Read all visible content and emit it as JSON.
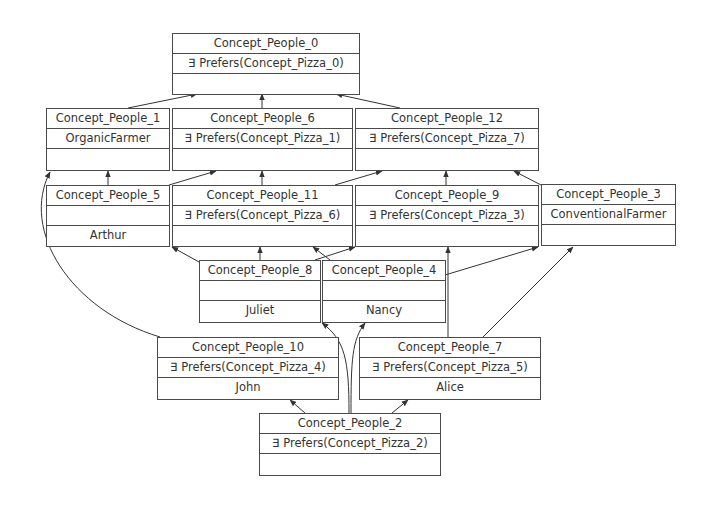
{
  "diagram": {
    "type": "concept-lattice",
    "colors": {
      "border": "#4a4a4a",
      "text": "#333333",
      "edge": "#333333",
      "background": "#ffffff"
    },
    "nodes": {
      "c0": {
        "title": "Concept_People_0",
        "attributes": "∃ Prefers(Concept_Pizza_0)",
        "objects": ""
      },
      "c1": {
        "title": "Concept_People_1",
        "attributes": "OrganicFarmer",
        "objects": ""
      },
      "c6": {
        "title": "Concept_People_6",
        "attributes": "∃ Prefers(Concept_Pizza_1)",
        "objects": ""
      },
      "c12": {
        "title": "Concept_People_12",
        "attributes": "∃ Prefers(Concept_Pizza_7)",
        "objects": ""
      },
      "c5": {
        "title": "Concept_People_5",
        "attributes": "",
        "objects": "Arthur"
      },
      "c11": {
        "title": "Concept_People_11",
        "attributes": "∃ Prefers(Concept_Pizza_6)",
        "objects": ""
      },
      "c9": {
        "title": "Concept_People_9",
        "attributes": "∃ Prefers(Concept_Pizza_3)",
        "objects": ""
      },
      "c3": {
        "title": "Concept_People_3",
        "attributes": "ConventionalFarmer",
        "objects": ""
      },
      "c8": {
        "title": "Concept_People_8",
        "attributes": "",
        "objects": "Juliet"
      },
      "c4": {
        "title": "Concept_People_4",
        "attributes": "",
        "objects": "Nancy"
      },
      "c10": {
        "title": "Concept_People_10",
        "attributes": "∃ Prefers(Concept_Pizza_4)",
        "objects": "John"
      },
      "c7": {
        "title": "Concept_People_7",
        "attributes": "∃ Prefers(Concept_Pizza_5)",
        "objects": "Alice"
      },
      "c2": {
        "title": "Concept_People_2",
        "attributes": "∃ Prefers(Concept_Pizza_2)",
        "objects": ""
      }
    },
    "edges": [
      {
        "from": "c1",
        "to": "c0"
      },
      {
        "from": "c6",
        "to": "c0"
      },
      {
        "from": "c12",
        "to": "c0"
      },
      {
        "from": "c5",
        "to": "c1"
      },
      {
        "from": "c5",
        "to": "c6"
      },
      {
        "from": "c11",
        "to": "c6"
      },
      {
        "from": "c11",
        "to": "c12"
      },
      {
        "from": "c9",
        "to": "c12"
      },
      {
        "from": "c3",
        "to": "c12"
      },
      {
        "from": "c8",
        "to": "c5"
      },
      {
        "from": "c8",
        "to": "c11"
      },
      {
        "from": "c4",
        "to": "c11"
      },
      {
        "from": "c4",
        "to": "c9"
      },
      {
        "from": "c10",
        "to": "c1"
      },
      {
        "from": "c10",
        "to": "c9"
      },
      {
        "from": "c7",
        "to": "c9"
      },
      {
        "from": "c7",
        "to": "c3"
      },
      {
        "from": "c2",
        "to": "c10"
      },
      {
        "from": "c2",
        "to": "c7"
      },
      {
        "from": "c2",
        "to": "c8"
      },
      {
        "from": "c2",
        "to": "c4"
      }
    ]
  }
}
